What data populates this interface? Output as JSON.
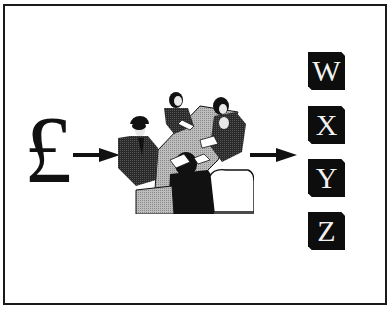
{
  "diagram": {
    "input": {
      "symbol": "£",
      "meaning": "pound-sterling"
    },
    "process": {
      "icon": "business-meeting"
    },
    "outputs": [
      {
        "label": "W"
      },
      {
        "label": "X"
      },
      {
        "label": "Y"
      },
      {
        "label": "Z"
      }
    ],
    "colors": {
      "ink": "#111111",
      "box_fill": "#0d0d0d",
      "box_text": "#f2f2f2",
      "table_gray": "#b8b8b8",
      "suit_dark": "#333333",
      "background": "#ffffff"
    }
  }
}
